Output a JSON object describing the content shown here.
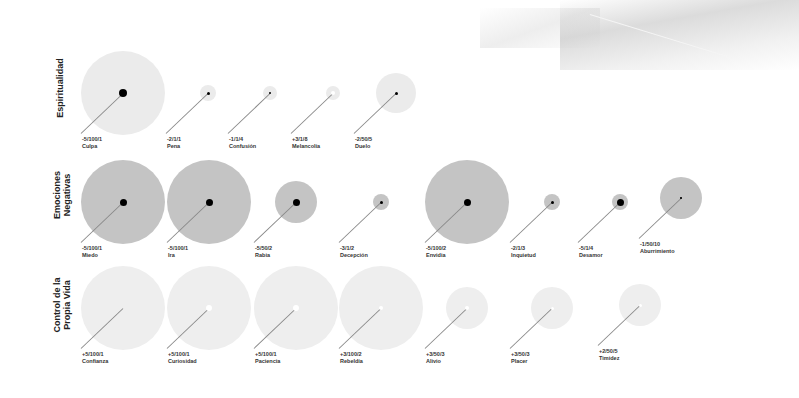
{
  "chart_data": {
    "type": "scatter",
    "title": "",
    "subtitle": "",
    "legend": [],
    "colors": {
      "row1_fill": "#ebebeb",
      "row2_fill": "#c4c4c4",
      "row3_fill": "#eeeeee",
      "dot_dark": "#000000",
      "dot_white": "#ffffff",
      "leader": "#888888"
    },
    "rows": [
      {
        "label": "Espiritualidad",
        "items": [
          {
            "name": "Culpa",
            "code": "-5/100/1",
            "cx": 123,
            "cy": 93,
            "r": 42,
            "dot": "dark",
            "dot_r": 4
          },
          {
            "name": "Pena",
            "code": "-2/1/1",
            "cx": 208,
            "cy": 93,
            "r": 8,
            "dot": "dark",
            "dot_r": 1.5
          },
          {
            "name": "Confusión",
            "code": "-1/1/4",
            "cx": 270,
            "cy": 93,
            "r": 7,
            "dot": "dark",
            "dot_r": 1
          },
          {
            "name": "Melancolía",
            "code": "+3/1/8",
            "cx": 333,
            "cy": 93,
            "r": 7,
            "dot": "white",
            "dot_r": 2
          },
          {
            "name": "Duelo",
            "code": "-2/50/5",
            "cx": 396,
            "cy": 93,
            "r": 20,
            "dot": "dark",
            "dot_r": 1.5
          }
        ]
      },
      {
        "label": "Emociones Negativas",
        "items": [
          {
            "name": "Miedo",
            "code": "-5/100/1",
            "cx": 123,
            "cy": 202,
            "r": 42,
            "dot": "dark",
            "dot_r": 3.5
          },
          {
            "name": "Ira",
            "code": "-5/100/1",
            "cx": 209,
            "cy": 202,
            "r": 42,
            "dot": "dark",
            "dot_r": 3.5
          },
          {
            "name": "Rabia",
            "code": "-5/50/2",
            "cx": 296,
            "cy": 202,
            "r": 21,
            "dot": "dark",
            "dot_r": 3.5
          },
          {
            "name": "Decepción",
            "code": "-3/1/2",
            "cx": 381,
            "cy": 202,
            "r": 8,
            "dot": "dark",
            "dot_r": 1.5
          },
          {
            "name": "Envidia",
            "code": "-5/100/2",
            "cx": 467,
            "cy": 202,
            "r": 42,
            "dot": "dark",
            "dot_r": 3.5
          },
          {
            "name": "Inquietud",
            "code": "-2/1/3",
            "cx": 552,
            "cy": 202,
            "r": 8,
            "dot": "dark",
            "dot_r": 1.5
          },
          {
            "name": "Desamor",
            "code": "-5/1/4",
            "cx": 620,
            "cy": 202,
            "r": 8,
            "dot": "dark",
            "dot_r": 3.5
          },
          {
            "name": "Aburrimiento",
            "code": "-1/50/10",
            "cx": 681,
            "cy": 198,
            "r": 21,
            "dot": "dark",
            "dot_r": 0.8
          }
        ]
      },
      {
        "label": "Control de la Propia Vida",
        "items": [
          {
            "name": "Confianza",
            "code": "+5/100/1",
            "cx": 123,
            "cy": 308,
            "r": 42,
            "dot": "none",
            "dot_r": 0
          },
          {
            "name": "Curiosidad",
            "code": "+5/100/1",
            "cx": 209,
            "cy": 308,
            "r": 42,
            "dot": "white",
            "dot_r": 3
          },
          {
            "name": "Paciencia",
            "code": "+5/100/1",
            "cx": 296,
            "cy": 308,
            "r": 42,
            "dot": "white",
            "dot_r": 3
          },
          {
            "name": "Rebeldía",
            "code": "+3/100/2",
            "cx": 381,
            "cy": 308,
            "r": 42,
            "dot": "white",
            "dot_r": 2
          },
          {
            "name": "Alivio",
            "code": "+3/50/3",
            "cx": 467,
            "cy": 308,
            "r": 21,
            "dot": "white",
            "dot_r": 2
          },
          {
            "name": "Placer",
            "code": "+3/50/3",
            "cx": 552,
            "cy": 308,
            "r": 21,
            "dot": "white",
            "dot_r": 1.5
          },
          {
            "name": "Timidez",
            "code": "+2/50/5",
            "cx": 640,
            "cy": 305,
            "r": 21,
            "dot": "white",
            "dot_r": 1.5
          }
        ]
      }
    ],
    "row_label_positions": [
      {
        "x": 55,
        "y": 128
      },
      {
        "x": 52,
        "y": 235
      },
      {
        "x": 52,
        "y": 345
      }
    ]
  }
}
